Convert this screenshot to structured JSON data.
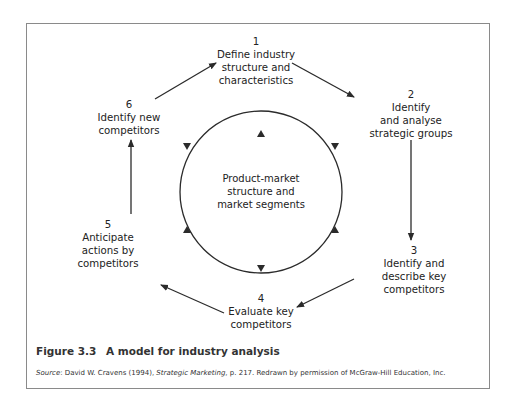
{
  "diagram": {
    "center": {
      "lines": [
        "Product-market",
        "structure and",
        "market segments"
      ]
    },
    "nodes": [
      {
        "number": "1",
        "lines": [
          "Define industry",
          "structure and",
          "characteristics"
        ]
      },
      {
        "number": "2",
        "lines": [
          "Identify",
          "and analyse",
          "strategic groups"
        ]
      },
      {
        "number": "3",
        "lines": [
          "Identify and",
          "describe key",
          "competitors"
        ]
      },
      {
        "number": "4",
        "lines": [
          "Evaluate key",
          "competitors"
        ]
      },
      {
        "number": "5",
        "lines": [
          "Anticipate",
          "actions by",
          "competitors"
        ]
      },
      {
        "number": "6",
        "lines": [
          "Identify new",
          "competitors"
        ]
      }
    ],
    "flow": [
      "1→2",
      "2→3",
      "3→4",
      "4→5",
      "5→6",
      "6→1"
    ]
  },
  "caption": {
    "figure_number": "Figure 3.3",
    "title": "A model for industry analysis"
  },
  "source": {
    "label": "Source",
    "author": ": David W. Cravens (1994), ",
    "work": "Strategic Marketing",
    "rest": ", p. 217. Redrawn by permission of McGraw-Hill Education, Inc."
  },
  "colors": {
    "line": "#2b2b2b",
    "frame": "#8a8a8a",
    "text": "#222222"
  }
}
